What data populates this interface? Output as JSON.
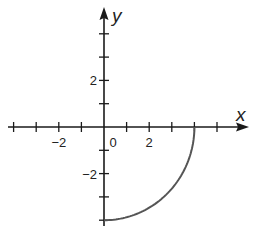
{
  "chart_data": {
    "type": "line",
    "title": "",
    "xlabel": "x",
    "ylabel": "y",
    "xlim": [
      -4.5,
      6.2
    ],
    "ylim": [
      -4.5,
      5.2
    ],
    "grid": false,
    "legend": null,
    "x_ticks": [
      -4,
      -3,
      -2,
      -1,
      0,
      1,
      2,
      3,
      4,
      5
    ],
    "y_ticks": [
      -4,
      -3,
      -2,
      -1,
      1,
      2,
      3,
      4
    ],
    "x_tick_labels": [
      {
        "value": -2,
        "text": "−2"
      },
      {
        "value": 0,
        "text": "0"
      },
      {
        "value": 2,
        "text": "2"
      }
    ],
    "y_tick_labels": [
      {
        "value": 2,
        "text": "2"
      },
      {
        "value": -2,
        "text": "−2"
      }
    ],
    "series": [
      {
        "name": "quarter circle",
        "description": "Arc of circle x^2 + y^2 = 16 in fourth quadrant, from (4,0) to (0,-4)",
        "color": "#555555",
        "x": [
          4,
          3.864,
          3.464,
          2.828,
          2,
          1.035,
          0
        ],
        "y": [
          0,
          -1.035,
          -2,
          -2.828,
          -3.464,
          -3.864,
          -4
        ]
      }
    ]
  },
  "colors": {
    "axis": "#1a1a1a",
    "curve": "#555555",
    "background": "#ffffff"
  }
}
